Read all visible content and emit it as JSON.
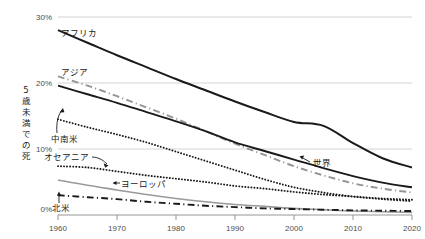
{
  "chart_data": {
    "type": "line",
    "title": "",
    "xlabel": "",
    "ylabel": "5歳未満での死",
    "xlim": [
      1960,
      2020
    ],
    "ylim": [
      0,
      30
    ],
    "grid": true,
    "legend_position": "inline-annotations",
    "x_ticks": [
      "1960",
      "1970",
      "1980",
      "1990",
      "2000",
      "2010",
      "2020"
    ],
    "y_ticks": [
      "0%",
      "10%",
      "20%",
      "30%"
    ],
    "x": [
      1960,
      1965,
      1970,
      1975,
      1980,
      1985,
      1990,
      1995,
      2000,
      2005,
      2010,
      2015,
      2020
    ],
    "series": [
      {
        "name": "アフリカ",
        "style": "solid",
        "color": "#1a1a1a",
        "width": 2.0,
        "values": [
          28.0,
          26.1,
          24.2,
          22.4,
          20.6,
          18.9,
          17.2,
          15.6,
          14.1,
          13.5,
          10.9,
          8.6,
          7.2
        ]
      },
      {
        "name": "アジア",
        "style": "dashdot",
        "color": "#949494",
        "width": 1.9,
        "values": [
          21.0,
          19.6,
          18.0,
          16.3,
          14.6,
          12.7,
          10.8,
          9.1,
          7.4,
          6.0,
          4.8,
          4.0,
          3.4
        ]
      },
      {
        "name": "世界",
        "style": "solid",
        "color": "#1a1a1a",
        "width": 1.9,
        "values": [
          19.6,
          18.3,
          17.0,
          15.6,
          14.2,
          12.7,
          11.0,
          9.7,
          8.4,
          7.1,
          5.9,
          4.9,
          4.2
        ]
      },
      {
        "name": "中南米",
        "style": "dotted",
        "color": "#1a1a1a",
        "width": 1.9,
        "values": [
          14.5,
          13.3,
          12.2,
          11.0,
          9.6,
          8.2,
          6.8,
          5.4,
          4.2,
          3.4,
          2.8,
          2.4,
          2.1
        ]
      },
      {
        "name": "オセアニア",
        "style": "dotted",
        "color": "#1a1a1a",
        "width": 1.9,
        "values": [
          7.4,
          7.2,
          6.6,
          6.0,
          5.5,
          5.0,
          4.4,
          4.0,
          3.5,
          3.1,
          2.8,
          2.5,
          2.3
        ]
      },
      {
        "name": "ヨーロッパ",
        "style": "solid",
        "color": "#9a9a9a",
        "width": 1.6,
        "values": [
          5.3,
          4.5,
          3.8,
          3.1,
          2.5,
          2.0,
          1.6,
          1.3,
          1.0,
          0.8,
          0.6,
          0.5,
          0.4
        ]
      },
      {
        "name": "北米",
        "style": "dashdot",
        "color": "#1a1a1a",
        "width": 1.9,
        "values": [
          3.0,
          2.7,
          2.4,
          2.0,
          1.7,
          1.4,
          1.2,
          1.0,
          0.9,
          0.8,
          0.7,
          0.65,
          0.6
        ]
      }
    ],
    "annotations": [
      {
        "text": "アフリカ",
        "kind": "label"
      },
      {
        "text": "アジア",
        "kind": "label"
      },
      {
        "text": "中南米",
        "kind": "label-with-curved-arrow"
      },
      {
        "text": "オセアニア",
        "kind": "label-with-curved-arrow"
      },
      {
        "text": "ヨーロッパ",
        "kind": "label-with-arrow"
      },
      {
        "text": "北米",
        "kind": "label-with-arrow"
      },
      {
        "text": "世界",
        "kind": "label-with-arrow"
      }
    ]
  },
  "labels": {
    "y_axis_title": "5歳未満での死",
    "africa": "アフリカ",
    "asia": "アジア",
    "latin_america": "中南米",
    "oceania": "オセアニア",
    "europe": "ヨーロッパ",
    "north_america": "北米",
    "world": "世界",
    "y0": "0%",
    "y10": "10%",
    "y20": "20%",
    "y30": "30%",
    "x1960": "1960",
    "x1970": "1970",
    "x1980": "1980",
    "x1990": "1990",
    "x2000": "2000",
    "x2010": "2010",
    "x2020": "2020"
  }
}
